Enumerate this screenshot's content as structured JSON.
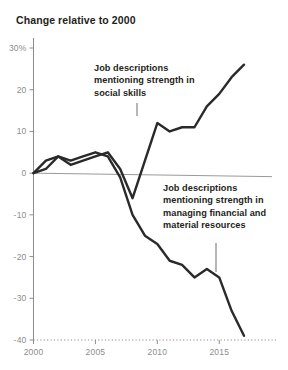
{
  "chart": {
    "title": "Change relative to 2000",
    "annotations": [
      {
        "id": "social",
        "text": "Job descriptions mentioning strength in social skills"
      },
      {
        "id": "resources",
        "text": "Job descriptions mentioning strength in managing financial and material resources"
      }
    ]
  },
  "chart_data": {
    "type": "line",
    "title": "Change relative to 2000",
    "xlabel": "",
    "ylabel": "",
    "xlim": [
      2000,
      2017
    ],
    "ylim": [
      -40,
      30
    ],
    "yticks": [
      30,
      20,
      10,
      0,
      -10,
      -20,
      -30,
      -40
    ],
    "ytick_labels": [
      "30%",
      "20",
      "10",
      "0",
      "-10",
      "-20",
      "-30",
      "-40"
    ],
    "xticks": [
      2000,
      2005,
      2010,
      2015
    ],
    "xtick_labels": [
      "2000",
      "2005",
      "2010",
      "2015"
    ],
    "grid": false,
    "legend": "none",
    "zero_line": true,
    "baseline_dotted_at": -40,
    "line_color": "#2a2a2a",
    "axis_color": "#8d8d8d",
    "x": [
      2000,
      2001,
      2002,
      2003,
      2004,
      2005,
      2006,
      2007,
      2008,
      2009,
      2010,
      2011,
      2012,
      2013,
      2014,
      2015,
      2016,
      2017
    ],
    "series": [
      {
        "name": "Job descriptions mentioning strength in social skills",
        "values": [
          0,
          3,
          4,
          2,
          3,
          4,
          5,
          1,
          -6,
          3,
          12,
          10,
          11,
          11,
          16,
          19,
          23,
          26
        ]
      },
      {
        "name": "Job descriptions mentioning strength in managing financial and material resources",
        "values": [
          0,
          1,
          4,
          3,
          4,
          5,
          4,
          -1,
          -10,
          -15,
          -17,
          -21,
          -22,
          -25,
          -23,
          -25,
          -33,
          -39
        ]
      }
    ]
  }
}
